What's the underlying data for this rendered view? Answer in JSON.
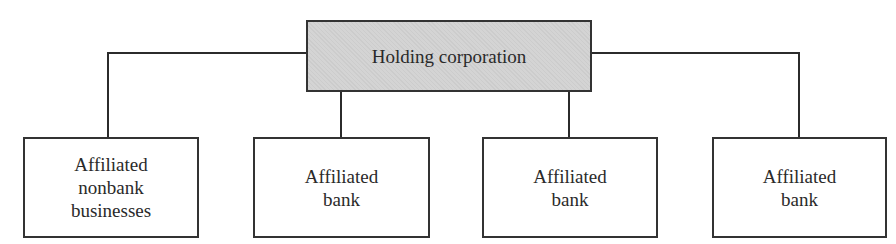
{
  "diagram": {
    "type": "org-chart",
    "root": {
      "label": "Holding corporation",
      "fill": "#d4d4d4"
    },
    "children": [
      {
        "label": "Affiliated\nnonbank\nbusinesses"
      },
      {
        "label": "Affiliated\nbank"
      },
      {
        "label": "Affiliated\nbank"
      },
      {
        "label": "Affiliated\nbank"
      }
    ],
    "line_color": "#2b2b2b"
  }
}
